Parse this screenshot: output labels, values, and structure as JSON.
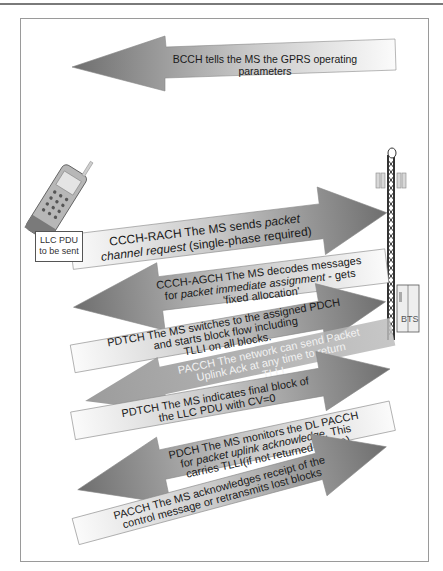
{
  "diagram": {
    "actors": {
      "ms": {
        "icon": "mobile-phone-icon",
        "label_line1": "LLC PDU",
        "label_line2": "to be sent"
      },
      "network": {
        "icon": "antenna-tower-icon",
        "bts_label": "BTS"
      }
    },
    "colors": {
      "arrow_dark": "#7d7d7d",
      "arrow_light": "#f5f5f5",
      "pacch_overlay": "#a8a8a8",
      "frame_border": "#9a9a9a",
      "text": "#1a1a1a"
    },
    "steps": [
      {
        "direction": "network-to-ms",
        "channel": "BCCH",
        "line1": "BCCH tells the MS the GPRS operating",
        "line2": "parameters",
        "line3": ""
      },
      {
        "direction": "ms-to-network",
        "channel": "CCCH-RACH",
        "line1": "CCCH-RACH The MS sends ",
        "line1_italic": "packet",
        "line2_italic": "channel request",
        "line2": " (single-phase required)"
      },
      {
        "direction": "network-to-ms",
        "channel": "CCCH-AGCH",
        "line1": "CCCH-AGCH The MS decodes messages",
        "line2_pre": "for ",
        "line2_italic": "packet immediate assignment",
        "line2": " - gets",
        "line3": "'fixed allocation'"
      },
      {
        "direction": "ms-to-network",
        "channel": "PDTCH",
        "line1": "PDTCH The MS switches to the assigned PDCH",
        "line2": "and starts block flow including",
        "line3": "TLLI on all  blocks."
      },
      {
        "direction": "network-to-ms",
        "channel": "PACCH",
        "line1": "PACCH  The network can send Packet",
        "line2": "Uplink Ack at any time to return",
        "line3": "TLLI"
      },
      {
        "direction": "ms-to-network",
        "channel": "PDTCH",
        "line1": "PDTCH The MS indicates final block of",
        "line2": "the LLC PDU with CV=0",
        "line3": ""
      },
      {
        "direction": "network-to-ms",
        "channel": "PDCH",
        "line1": "PDCH The MS monitors the DL PACCH",
        "line2_pre": "for ",
        "line2_italic": "packet uplink acknowledge.",
        "line2": " This",
        "line3": "carries TLLI(if not returned before)"
      },
      {
        "direction": "ms-to-network",
        "channel": "PACCH",
        "line1": "PACCH The MS acknowledges receipt of the",
        "line2": "control message or retransmits lost blocks",
        "line3": ""
      }
    ]
  }
}
